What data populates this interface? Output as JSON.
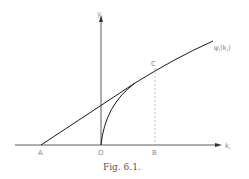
{
  "figure": {
    "caption": "Fig. 6.1.",
    "axes": {
      "x_label": "k",
      "x_label_sub": "i",
      "y_label": "y",
      "y_label_sub": "i"
    },
    "points": {
      "A": "A",
      "O": "O",
      "B": "B",
      "C": "C"
    },
    "curve_label": "ψ",
    "curve_label_sub": "i",
    "curve_label_arg": "(k",
    "curve_label_arg_sub": "i",
    "curve_label_close": ")",
    "colors": {
      "line": "#1a1a1a",
      "dashed": "#9a9a9a",
      "label": "#8a8a8a"
    }
  }
}
